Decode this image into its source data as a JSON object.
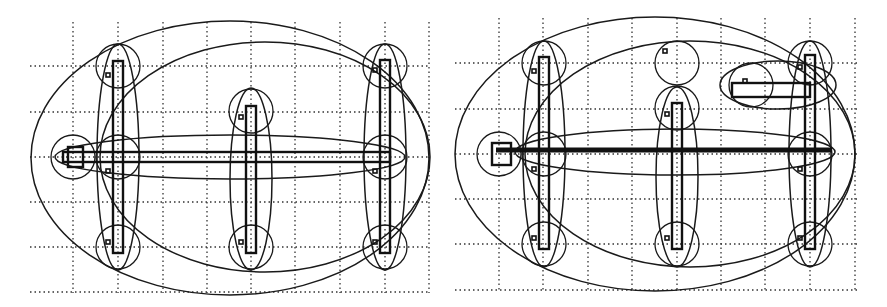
{
  "figure": {
    "panels": [
      {
        "id": "left",
        "description": "Grid with three vertical bars and one horizontal bar, enclosed by node circles and nested ellipses",
        "vertical_bars": 3,
        "horizontal_bars": 1,
        "small_squares": 7
      },
      {
        "id": "right",
        "description": "Grid with three vertical bars, one thick horizontal bar, an extra free circle and a short horizontal branch, enclosed by nested ellipses",
        "vertical_bars": 3,
        "horizontal_bars": 2,
        "small_squares": 9
      }
    ],
    "colors": {
      "ink": "#1a1a1a",
      "background": "#ffffff",
      "grid": "#333333"
    }
  }
}
